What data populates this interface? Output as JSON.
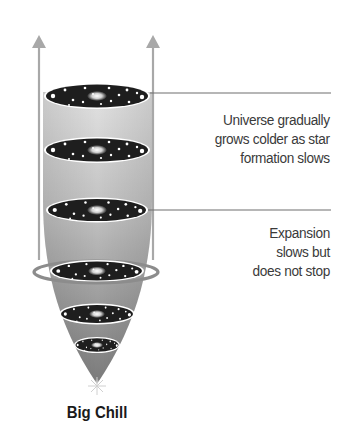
{
  "diagram": {
    "title": "Big Chill",
    "annotations": [
      {
        "id": "star-formation",
        "lines": [
          "Universe gradually",
          "grows colder as star",
          "formation slows"
        ]
      },
      {
        "id": "expansion",
        "lines": [
          "Expansion",
          "slows but",
          "does not stop"
        ]
      }
    ],
    "galaxy_disk_count": 6,
    "colors": {
      "cone_top": "#dcdcdc",
      "cone_bottom": "#7e7e7e",
      "arrow": "#a8a8a8",
      "disk": "#1e1e1e",
      "disk_rim": "#ffffff",
      "ring": "#8c8c8c",
      "leader_line": "#6e6e6e",
      "text": "#3a3a3a"
    }
  }
}
